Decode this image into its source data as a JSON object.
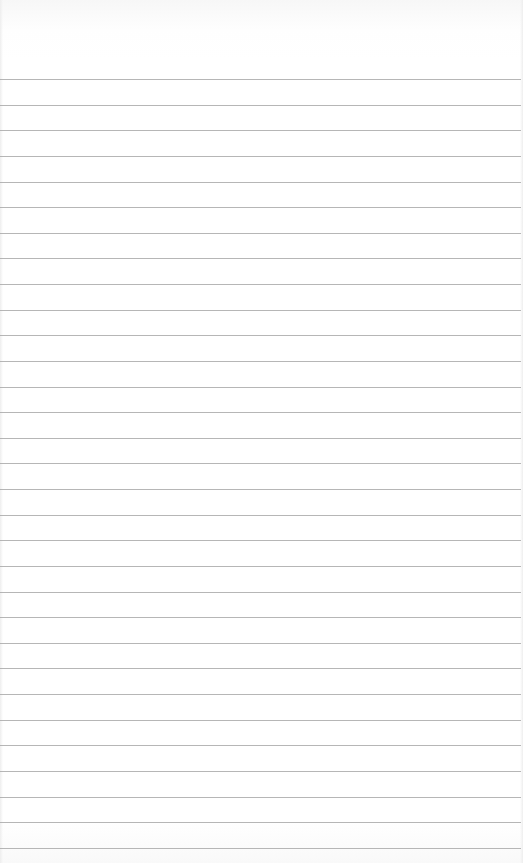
{
  "page": {
    "type": "lined-paper",
    "background_color": "#ffffff",
    "rule_color": "#a9a9a9",
    "rules": {
      "count": 31,
      "first_y": 79,
      "spacing": 25.63
    }
  }
}
